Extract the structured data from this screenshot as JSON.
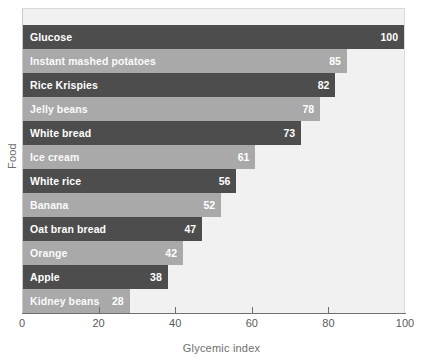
{
  "chart_data": {
    "type": "bar",
    "orientation": "horizontal",
    "title": "",
    "xlabel": "Glycemic index",
    "ylabel": "Food",
    "xlim": [
      0,
      100
    ],
    "xticks": [
      0,
      20,
      40,
      60,
      80,
      100
    ],
    "grid": false,
    "legend": null,
    "categories": [
      "Glucose",
      "Instant mashed potatoes",
      "Rice Krispies",
      "Jelly beans",
      "White bread",
      "Ice cream",
      "White rice",
      "Banana",
      "Oat bran bread",
      "Orange",
      "Apple",
      "Kidney beans"
    ],
    "values": [
      100,
      85,
      82,
      78,
      73,
      61,
      56,
      52,
      47,
      42,
      38,
      28
    ],
    "bars": [
      {
        "label": "Glucose",
        "value": 100,
        "shade": "dark"
      },
      {
        "label": "Instant mashed potatoes",
        "value": 85,
        "shade": "light"
      },
      {
        "label": "Rice Krispies",
        "value": 82,
        "shade": "dark"
      },
      {
        "label": "Jelly beans",
        "value": 78,
        "shade": "light"
      },
      {
        "label": "White bread",
        "value": 73,
        "shade": "dark"
      },
      {
        "label": "Ice cream",
        "value": 61,
        "shade": "light"
      },
      {
        "label": "White rice",
        "value": 56,
        "shade": "dark"
      },
      {
        "label": "Banana",
        "value": 52,
        "shade": "light"
      },
      {
        "label": "Oat bran bread",
        "value": 47,
        "shade": "dark"
      },
      {
        "label": "Orange",
        "value": 42,
        "shade": "light"
      },
      {
        "label": "Apple",
        "value": 38,
        "shade": "dark"
      },
      {
        "label": "Kidney beans",
        "value": 28,
        "shade": "light"
      }
    ],
    "colors": {
      "bar_dark": "#4d4d4d",
      "bar_light": "#a9a9a9",
      "plot_background": "#f1f1f1",
      "axis": "#6f6f6f",
      "value_text": "#ffffff",
      "axis_text": "#5a5a5a"
    }
  }
}
